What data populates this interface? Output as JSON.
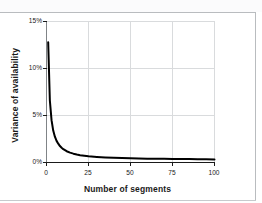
{
  "figure": {
    "background_color": "#ffffff",
    "frame_color": "#b9bcbf"
  },
  "chart_data": {
    "type": "line",
    "title": "",
    "subtitle": "",
    "xlabel": "Number of segments",
    "ylabel": "Variance of availability",
    "xlim": [
      0,
      100
    ],
    "ylim": [
      0,
      15
    ],
    "xticks": [
      0,
      25,
      50,
      75,
      100
    ],
    "yticks": [
      0,
      5,
      10,
      15
    ],
    "xtick_labels": [
      "0",
      "25",
      "50",
      "75",
      "100"
    ],
    "ytick_labels": [
      "0%",
      "5%",
      "10%",
      "15%"
    ],
    "y_unit": "%",
    "grid": true,
    "grid_color": "#d9dbdd",
    "legend": false,
    "legend_position": "none",
    "line_color": "#000000",
    "line_width": 2.0,
    "annotations": [],
    "series": [
      {
        "name": "Variance of availability",
        "x": [
          1,
          2,
          3,
          4,
          5,
          6,
          7,
          8,
          9,
          10,
          12,
          14,
          16,
          18,
          20,
          25,
          30,
          35,
          40,
          45,
          50,
          55,
          60,
          65,
          70,
          75,
          80,
          85,
          90,
          95,
          100
        ],
        "values": [
          12.8,
          6.6,
          4.5,
          3.4,
          2.75,
          2.3,
          2.0,
          1.75,
          1.57,
          1.42,
          1.2,
          1.05,
          0.94,
          0.85,
          0.78,
          0.66,
          0.59,
          0.54,
          0.5,
          0.47,
          0.45,
          0.43,
          0.41,
          0.4,
          0.39,
          0.38,
          0.37,
          0.36,
          0.35,
          0.34,
          0.33
        ]
      }
    ]
  }
}
